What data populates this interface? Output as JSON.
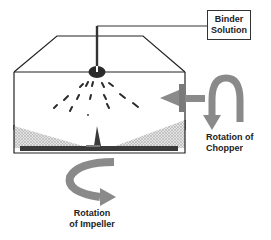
{
  "labels": {
    "binder_line1": "Binder",
    "binder_line2": "Solution",
    "chopper_line1": "Rotation of",
    "chopper_line2": "Chopper",
    "impeller_line1": "Rotation",
    "impeller_line2": "of Impeller"
  },
  "colors": {
    "outline": "#222222",
    "nozzle": "#2a2a2a",
    "arrow": "#8a8a8a",
    "powder": "#d0d0d0",
    "plate": "#3a3a3a"
  }
}
